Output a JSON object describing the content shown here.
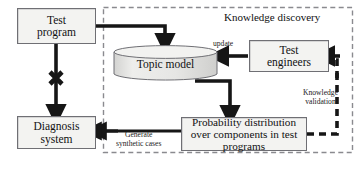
{
  "diagram": {
    "title": "Knowledge discovery",
    "region": {
      "name": "knowledge-discovery-region",
      "label": "Knowledge discovery",
      "border_style": "dashed",
      "border_color": "#8a8a8f"
    },
    "nodes": [
      {
        "id": "test-program",
        "label": "Test\nprogram",
        "line1": "Test",
        "line2": "program",
        "shape": "rectangle"
      },
      {
        "id": "diagnosis-system",
        "label": "Diagnosis\nsystem",
        "line1": "Diagnosis",
        "line2": "system",
        "shape": "rectangle"
      },
      {
        "id": "topic-model",
        "label": "Topic model",
        "shape": "cylinder"
      },
      {
        "id": "test-engineers",
        "label": "Test\nengineers",
        "line1": "Test",
        "line2": "engineers",
        "shape": "rectangle"
      },
      {
        "id": "probability-distribution",
        "label": "Probability distribution over components in test programs",
        "line1": "Probability distribution",
        "line2": "over components in test",
        "line3": "programs",
        "shape": "rectangle"
      }
    ],
    "edges": [
      {
        "id": "test-program-to-topic-model",
        "from": "test-program",
        "to": "topic-model",
        "label": ""
      },
      {
        "id": "test-program-to-diagnosis-system",
        "from": "test-program",
        "to": "diagnosis-system",
        "label": "",
        "blocked": true,
        "marker": "x-cross"
      },
      {
        "id": "test-engineers-to-topic-model",
        "from": "test-engineers",
        "to": "topic-model",
        "label": "update"
      },
      {
        "id": "topic-model-to-probability",
        "from": "topic-model",
        "to": "probability-distribution",
        "label": ""
      },
      {
        "id": "probability-to-diagnosis-system",
        "from": "probability-distribution",
        "to": "diagnosis-system",
        "label": "Generate synthetic cases",
        "label_line1": "Generate",
        "label_line2": "synthetic cases"
      },
      {
        "id": "probability-to-test-engineers",
        "from": "probability-distribution",
        "to": "test-engineers",
        "label": "Knowledge validation",
        "label_line1": "Knowledge",
        "label_line2": "validation",
        "style": "dashed"
      }
    ],
    "labels": {
      "update": "update",
      "generate_line1": "Generate",
      "generate_line2": "synthetic cases",
      "knowledge_line1": "Knowledge",
      "knowledge_line2": "validation"
    },
    "colors": {
      "box_fill": "#f3f3f1",
      "box_stroke": "#6f6f74",
      "arrow": "#161616",
      "cylinder_fill": "#e4e4e2",
      "cylinder_top": "#f0f0ee",
      "background": "#ffffff"
    }
  }
}
